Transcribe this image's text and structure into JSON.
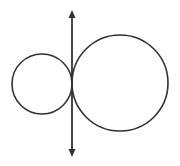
{
  "diagram": {
    "stroke_color": "#333333",
    "background": "#ffffff",
    "tangent_line": {
      "x": 72,
      "y1": 10,
      "y2": 157,
      "arrows": "both"
    },
    "circles": [
      {
        "name": "small-circle",
        "cx": 42,
        "cy": 84,
        "r": 30
      },
      {
        "name": "large-circle",
        "cx": 120,
        "cy": 83,
        "r": 48
      }
    ],
    "tangent_point": {
      "x": 72,
      "y": 84
    }
  }
}
